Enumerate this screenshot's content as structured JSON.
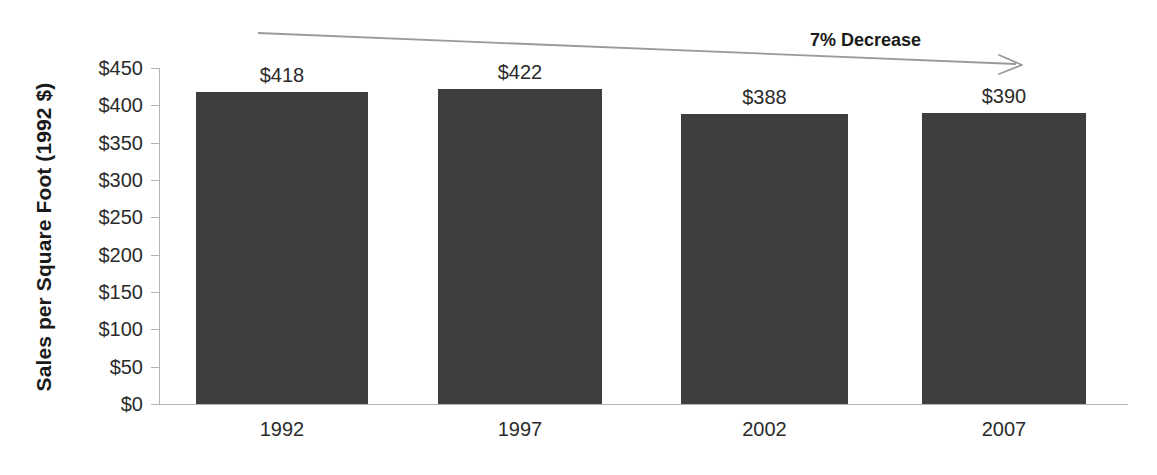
{
  "chart_data": {
    "type": "bar",
    "title": "",
    "subtitle": "",
    "xlabel": "",
    "ylabel": "Sales per Square Foot (1992 $)",
    "categories": [
      "1992",
      "1997",
      "2002",
      "2007"
    ],
    "values": [
      418,
      422,
      388,
      390
    ],
    "data_labels": [
      "$418",
      "$422",
      "$388",
      "$390"
    ],
    "ylim": [
      0,
      450
    ],
    "ytick_values": [
      0,
      50,
      100,
      150,
      200,
      250,
      300,
      350,
      400,
      450
    ],
    "ytick_labels": [
      "$0",
      "$50",
      "$100",
      "$150",
      "$200",
      "$250",
      "$300",
      "$350",
      "$400",
      "$450"
    ],
    "grid": false,
    "legend": null,
    "legend_position": "none",
    "bar_color": "#3e3e3e",
    "axis_color": "#b4b4b4",
    "text_color": "#2b2b2b",
    "annotations": [
      {
        "name": "decrease-callout",
        "text": "7% Decrease",
        "color": "#9a9a9a",
        "type": "arrow",
        "direction": "right-downward"
      }
    ]
  },
  "axis": {
    "y_title": "Sales per Square Foot (1992 $)"
  },
  "annotation": {
    "label": "7% Decrease"
  }
}
